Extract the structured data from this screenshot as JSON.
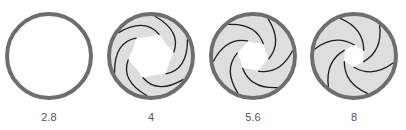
{
  "diagram": {
    "colors": {
      "ring": "#6e6e6e",
      "blade_fill": "#dedede",
      "blade_edge": "#1e1e1e",
      "opening": "#ffffff",
      "label": "#555555"
    },
    "blade_count": 6,
    "apertures": [
      {
        "label": "2.8",
        "cx": 49,
        "cy": 56,
        "r": 42,
        "opening_ratio": 1.0
      },
      {
        "label": "4",
        "cx": 151,
        "cy": 56,
        "r": 42,
        "opening_ratio": 0.58
      },
      {
        "label": "5.6",
        "cx": 253,
        "cy": 56,
        "r": 42,
        "opening_ratio": 0.4
      },
      {
        "label": "8",
        "cx": 354,
        "cy": 56,
        "r": 42,
        "opening_ratio": 0.28
      }
    ]
  }
}
